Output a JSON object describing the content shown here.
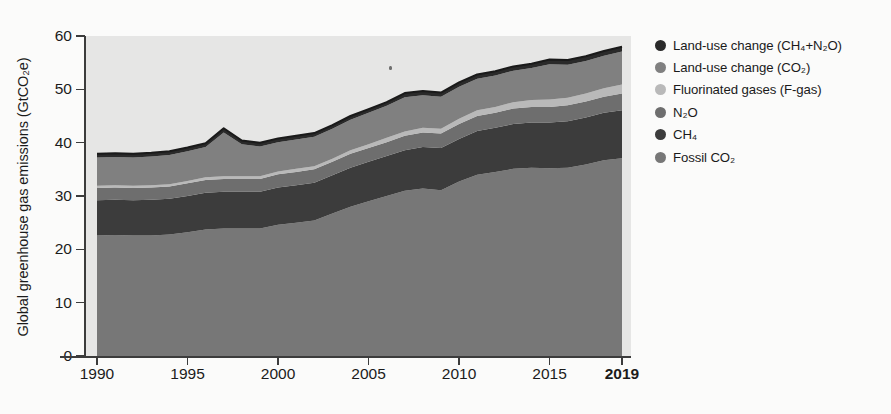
{
  "axes": {
    "y_title": "Global greenhouse gas emissions (GtCO₂e)",
    "y_ticks": [
      "0",
      "10",
      "20",
      "30",
      "40",
      "50",
      "60"
    ],
    "x_ticks": [
      "1990",
      "1995",
      "2000",
      "2005",
      "2010",
      "2015",
      "2019"
    ]
  },
  "legend": {
    "items": [
      {
        "label": "Land-use change (CH₄+N₂O)",
        "color": "#2a2a2a"
      },
      {
        "label": "Land-use change (CO₂)",
        "color": "#808080"
      },
      {
        "label": "Fluorinated gases (F-gas)",
        "color": "#b9b9b9"
      },
      {
        "label": "N₂O",
        "color": "#6e6e6e"
      },
      {
        "label": "CH₄",
        "color": "#3c3c3c"
      },
      {
        "label": "Fossil CO₂",
        "color": "#777777"
      }
    ]
  },
  "chart_data": {
    "type": "area",
    "stacked": true,
    "title": "",
    "xlabel": "",
    "ylabel": "Global greenhouse gas emissions (GtCO₂e)",
    "xlim": [
      1990,
      2019
    ],
    "ylim": [
      0,
      60
    ],
    "grid": false,
    "legend_position": "right",
    "plot_background": "#e6e6e5",
    "x": [
      1990,
      1991,
      1992,
      1993,
      1994,
      1995,
      1996,
      1997,
      1998,
      1999,
      2000,
      2001,
      2002,
      2003,
      2004,
      2005,
      2006,
      2007,
      2008,
      2009,
      2010,
      2011,
      2012,
      2013,
      2014,
      2015,
      2016,
      2017,
      2018,
      2019
    ],
    "series": [
      {
        "name": "Fossil CO₂",
        "color": "#777777",
        "values": [
          22.6,
          22.7,
          22.6,
          22.6,
          22.8,
          23.2,
          23.7,
          23.9,
          23.9,
          23.9,
          24.6,
          25.0,
          25.4,
          26.7,
          28.0,
          29.0,
          30.0,
          31.0,
          31.4,
          31.1,
          32.7,
          34.0,
          34.5,
          35.1,
          35.3,
          35.2,
          35.3,
          35.9,
          36.7,
          37.1
        ]
      },
      {
        "name": "CH₄",
        "color": "#3c3c3c",
        "values": [
          6.6,
          6.6,
          6.6,
          6.7,
          6.7,
          6.8,
          6.9,
          6.9,
          6.9,
          6.9,
          7.0,
          7.0,
          7.1,
          7.2,
          7.3,
          7.4,
          7.5,
          7.6,
          7.8,
          7.9,
          8.0,
          8.2,
          8.3,
          8.4,
          8.5,
          8.6,
          8.7,
          8.8,
          8.9,
          9.0
        ]
      },
      {
        "name": "N₂O",
        "color": "#6e6e6e",
        "values": [
          2.3,
          2.3,
          2.3,
          2.3,
          2.3,
          2.4,
          2.4,
          2.4,
          2.4,
          2.4,
          2.5,
          2.5,
          2.5,
          2.5,
          2.6,
          2.6,
          2.6,
          2.7,
          2.7,
          2.7,
          2.8,
          2.8,
          2.8,
          2.9,
          2.9,
          2.9,
          3.0,
          3.0,
          3.0,
          3.1
        ]
      },
      {
        "name": "Fluorinated gases (F-gas)",
        "color": "#b9b9b9",
        "values": [
          0.4,
          0.4,
          0.4,
          0.4,
          0.4,
          0.4,
          0.5,
          0.5,
          0.5,
          0.5,
          0.5,
          0.6,
          0.6,
          0.6,
          0.7,
          0.7,
          0.8,
          0.8,
          0.9,
          0.9,
          1.0,
          1.1,
          1.1,
          1.2,
          1.3,
          1.4,
          1.4,
          1.5,
          1.6,
          1.7
        ]
      },
      {
        "name": "Land-use change (CO₂)",
        "color": "#808080",
        "values": [
          5.3,
          5.3,
          5.3,
          5.4,
          5.5,
          5.6,
          5.7,
          8.2,
          6.0,
          5.6,
          5.5,
          5.5,
          5.5,
          5.6,
          5.7,
          5.9,
          6.0,
          6.4,
          6.1,
          6.0,
          6.0,
          5.9,
          5.9,
          5.9,
          6.0,
          6.6,
          6.2,
          6.1,
          6.1,
          6.2
        ]
      },
      {
        "name": "Land-use change (CH₄+N₂O)",
        "color": "#2a2a2a",
        "values": [
          0.7,
          0.7,
          0.7,
          0.7,
          0.7,
          0.7,
          0.7,
          0.8,
          0.7,
          0.7,
          0.7,
          0.7,
          0.7,
          0.7,
          0.7,
          0.7,
          0.7,
          0.8,
          0.8,
          0.8,
          0.8,
          0.8,
          0.8,
          0.8,
          0.8,
          0.9,
          0.9,
          0.9,
          0.9,
          0.9
        ]
      }
    ],
    "totals": [
      37.9,
      38.0,
      37.9,
      38.1,
      38.4,
      39.1,
      39.9,
      42.7,
      40.4,
      40.0,
      40.8,
      41.3,
      41.8,
      43.3,
      45.0,
      46.3,
      47.6,
      49.3,
      49.7,
      49.4,
      51.3,
      52.8,
      53.4,
      54.3,
      54.8,
      55.6,
      55.5,
      56.2,
      57.2,
      58.0
    ]
  }
}
